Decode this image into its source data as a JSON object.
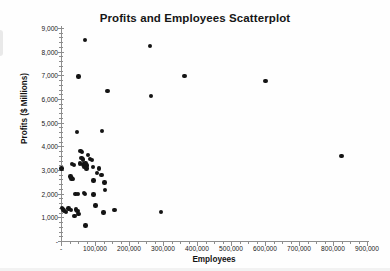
{
  "chart_data": {
    "type": "scatter",
    "title": "Profits and Employees Scatterplot",
    "xlabel": "Employees",
    "ylabel": "Profits ($ Millions)",
    "xlim": [
      0,
      900000
    ],
    "ylim": [
      0,
      9000
    ],
    "grid": false,
    "legend": null,
    "x_ticks": [
      0,
      100000,
      200000,
      300000,
      400000,
      500000,
      600000,
      700000,
      800000,
      900000
    ],
    "x_tick_labels": [
      "-",
      "100,000",
      "200,000",
      "300,000",
      "400,000",
      "500,000",
      "600,000",
      "700,000",
      "800,000",
      "900,000"
    ],
    "x_minor_step": 25000,
    "y_ticks": [
      0,
      1000,
      2000,
      3000,
      4000,
      5000,
      6000,
      7000,
      8000,
      9000
    ],
    "y_tick_labels": [
      "-",
      "1,000",
      "2,000",
      "3,000",
      "4,000",
      "5,000",
      "6,000",
      "7,000",
      "8,000",
      "9,000"
    ],
    "y_minor_step": 200,
    "marker": "filled-circle",
    "marker_color": "#141414",
    "points": [
      {
        "x": 2000,
        "y": 3070
      },
      {
        "x": 70000,
        "y": 8490
      },
      {
        "x": 262000,
        "y": 8250
      },
      {
        "x": 52000,
        "y": 6950
      },
      {
        "x": 363000,
        "y": 6960
      },
      {
        "x": 602000,
        "y": 6760
      },
      {
        "x": 137000,
        "y": 6340
      },
      {
        "x": 265000,
        "y": 6130
      },
      {
        "x": 47000,
        "y": 4610
      },
      {
        "x": 120000,
        "y": 4640
      },
      {
        "x": 825000,
        "y": 3590
      },
      {
        "x": 57000,
        "y": 3800
      },
      {
        "x": 62000,
        "y": 3760
      },
      {
        "x": 80000,
        "y": 3640
      },
      {
        "x": 60000,
        "y": 3510
      },
      {
        "x": 64000,
        "y": 3440
      },
      {
        "x": 86000,
        "y": 3470
      },
      {
        "x": 92000,
        "y": 3420
      },
      {
        "x": 33000,
        "y": 3250
      },
      {
        "x": 38000,
        "y": 3200
      },
      {
        "x": 55000,
        "y": 3270
      },
      {
        "x": 66000,
        "y": 3230
      },
      {
        "x": 72000,
        "y": 3280
      },
      {
        "x": 77000,
        "y": 3190
      },
      {
        "x": 69000,
        "y": 3120
      },
      {
        "x": 75000,
        "y": 3060
      },
      {
        "x": 94000,
        "y": 3120
      },
      {
        "x": 112000,
        "y": 3070
      },
      {
        "x": 106000,
        "y": 2870
      },
      {
        "x": 119000,
        "y": 2800
      },
      {
        "x": 28000,
        "y": 2730
      },
      {
        "x": 31000,
        "y": 2640
      },
      {
        "x": 36000,
        "y": 2620
      },
      {
        "x": 96000,
        "y": 2560
      },
      {
        "x": 128000,
        "y": 2480
      },
      {
        "x": 130000,
        "y": 2160
      },
      {
        "x": 43000,
        "y": 1990
      },
      {
        "x": 50000,
        "y": 1980
      },
      {
        "x": 67000,
        "y": 2020
      },
      {
        "x": 70000,
        "y": 1990
      },
      {
        "x": 96000,
        "y": 1960
      },
      {
        "x": 101000,
        "y": 1500
      },
      {
        "x": 125000,
        "y": 1200
      },
      {
        "x": 157000,
        "y": 1310
      },
      {
        "x": 294000,
        "y": 1230
      },
      {
        "x": 3000,
        "y": 1390
      },
      {
        "x": 6000,
        "y": 1330
      },
      {
        "x": 9000,
        "y": 1290
      },
      {
        "x": 14000,
        "y": 1230
      },
      {
        "x": 22000,
        "y": 1380
      },
      {
        "x": 30000,
        "y": 1320
      },
      {
        "x": 44000,
        "y": 1330
      },
      {
        "x": 49000,
        "y": 1280
      },
      {
        "x": 40000,
        "y": 1060
      },
      {
        "x": 52000,
        "y": 1130
      },
      {
        "x": 72000,
        "y": 650
      }
    ]
  }
}
